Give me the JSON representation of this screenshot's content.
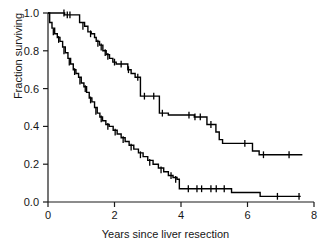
{
  "chart_data": {
    "type": "line",
    "title": "",
    "subtitle": "",
    "xlabel": "Years since liver resection",
    "ylabel": "Fraction surviving",
    "xlim": [
      0,
      8
    ],
    "ylim": [
      0.0,
      1.0
    ],
    "xticks": [
      0,
      2,
      4,
      6,
      8
    ],
    "xticklabels": [
      "0",
      "2",
      "4",
      "6",
      "8"
    ],
    "yticks": [
      0.0,
      0.2,
      0.4,
      0.6,
      0.8,
      1.0
    ],
    "yticklabels": [
      "0.0",
      "0.2",
      "0.4",
      "0.6",
      "0.8",
      "1.0"
    ],
    "grid": false,
    "legend": null,
    "legend_position": "none",
    "plot_kind": "kaplan-meier-step",
    "series": [
      {
        "name": "upper-curve",
        "style": "step",
        "color": "#000000",
        "points": [
          [
            0.0,
            1.0
          ],
          [
            0.45,
            1.0
          ],
          [
            0.5,
            0.99
          ],
          [
            0.9,
            0.99
          ],
          [
            0.95,
            0.95
          ],
          [
            1.1,
            0.93
          ],
          [
            1.2,
            0.9
          ],
          [
            1.3,
            0.89
          ],
          [
            1.4,
            0.87
          ],
          [
            1.45,
            0.85
          ],
          [
            1.55,
            0.83
          ],
          [
            1.65,
            0.8
          ],
          [
            1.75,
            0.78
          ],
          [
            1.85,
            0.76
          ],
          [
            1.95,
            0.74
          ],
          [
            2.05,
            0.73
          ],
          [
            2.35,
            0.73
          ],
          [
            2.4,
            0.7
          ],
          [
            2.5,
            0.68
          ],
          [
            2.62,
            0.66
          ],
          [
            2.72,
            0.66
          ],
          [
            2.78,
            0.56
          ],
          [
            3.3,
            0.56
          ],
          [
            3.35,
            0.47
          ],
          [
            3.55,
            0.47
          ],
          [
            3.62,
            0.46
          ],
          [
            4.3,
            0.46
          ],
          [
            4.4,
            0.45
          ],
          [
            4.7,
            0.45
          ],
          [
            4.78,
            0.41
          ],
          [
            5.0,
            0.41
          ],
          [
            5.05,
            0.37
          ],
          [
            5.15,
            0.33
          ],
          [
            5.25,
            0.31
          ],
          [
            6.05,
            0.31
          ],
          [
            6.15,
            0.27
          ],
          [
            6.35,
            0.25
          ],
          [
            7.65,
            0.25
          ]
        ],
        "censored": [
          [
            0.48,
            1.0
          ],
          [
            0.58,
            0.99
          ],
          [
            0.66,
            0.99
          ],
          [
            1.05,
            0.93
          ],
          [
            1.28,
            0.89
          ],
          [
            1.5,
            0.84
          ],
          [
            1.6,
            0.82
          ],
          [
            1.72,
            0.79
          ],
          [
            1.8,
            0.77
          ],
          [
            2.0,
            0.74
          ],
          [
            2.2,
            0.73
          ],
          [
            2.42,
            0.7
          ],
          [
            2.7,
            0.66
          ],
          [
            2.9,
            0.56
          ],
          [
            3.18,
            0.56
          ],
          [
            3.44,
            0.47
          ],
          [
            4.24,
            0.46
          ],
          [
            4.42,
            0.45
          ],
          [
            4.58,
            0.45
          ],
          [
            4.9,
            0.41
          ],
          [
            5.92,
            0.31
          ],
          [
            6.48,
            0.25
          ],
          [
            7.25,
            0.25
          ]
        ]
      },
      {
        "name": "lower-curve",
        "style": "step",
        "color": "#000000",
        "points": [
          [
            0.0,
            1.0
          ],
          [
            0.05,
            0.95
          ],
          [
            0.12,
            0.92
          ],
          [
            0.2,
            0.89
          ],
          [
            0.28,
            0.87
          ],
          [
            0.36,
            0.85
          ],
          [
            0.44,
            0.82
          ],
          [
            0.52,
            0.79
          ],
          [
            0.6,
            0.76
          ],
          [
            0.68,
            0.73
          ],
          [
            0.76,
            0.7
          ],
          [
            0.84,
            0.68
          ],
          [
            0.92,
            0.66
          ],
          [
            1.0,
            0.63
          ],
          [
            1.08,
            0.61
          ],
          [
            1.16,
            0.58
          ],
          [
            1.24,
            0.55
          ],
          [
            1.32,
            0.53
          ],
          [
            1.4,
            0.5
          ],
          [
            1.48,
            0.47
          ],
          [
            1.56,
            0.45
          ],
          [
            1.64,
            0.43
          ],
          [
            1.74,
            0.41
          ],
          [
            1.84,
            0.4
          ],
          [
            1.96,
            0.38
          ],
          [
            2.08,
            0.36
          ],
          [
            2.2,
            0.34
          ],
          [
            2.32,
            0.32
          ],
          [
            2.44,
            0.3
          ],
          [
            2.58,
            0.28
          ],
          [
            2.72,
            0.26
          ],
          [
            2.86,
            0.24
          ],
          [
            3.0,
            0.22
          ],
          [
            3.16,
            0.2
          ],
          [
            3.32,
            0.18
          ],
          [
            3.48,
            0.16
          ],
          [
            3.62,
            0.14
          ],
          [
            3.76,
            0.13
          ],
          [
            3.88,
            0.12
          ],
          [
            3.95,
            0.07
          ],
          [
            5.45,
            0.07
          ],
          [
            5.52,
            0.05
          ],
          [
            6.3,
            0.05
          ],
          [
            6.38,
            0.03
          ],
          [
            7.6,
            0.03
          ]
        ],
        "censored": [
          [
            0.16,
            0.9
          ],
          [
            0.32,
            0.86
          ],
          [
            0.48,
            0.8
          ],
          [
            0.64,
            0.74
          ],
          [
            0.8,
            0.69
          ],
          [
            0.96,
            0.64
          ],
          [
            1.12,
            0.6
          ],
          [
            1.28,
            0.54
          ],
          [
            1.44,
            0.48
          ],
          [
            1.6,
            0.44
          ],
          [
            1.8,
            0.4
          ],
          [
            2.02,
            0.37
          ],
          [
            2.26,
            0.33
          ],
          [
            2.5,
            0.29
          ],
          [
            2.78,
            0.25
          ],
          [
            3.06,
            0.21
          ],
          [
            3.4,
            0.17
          ],
          [
            3.7,
            0.14
          ],
          [
            3.84,
            0.12
          ],
          [
            4.22,
            0.07
          ],
          [
            4.48,
            0.07
          ],
          [
            4.62,
            0.07
          ],
          [
            4.9,
            0.07
          ],
          [
            5.06,
            0.07
          ],
          [
            5.3,
            0.07
          ],
          [
            6.9,
            0.03
          ],
          [
            7.55,
            0.03
          ]
        ]
      }
    ]
  },
  "axes": {
    "xlabel": "Years since liver resection",
    "ylabel": "Fraction surviving"
  }
}
